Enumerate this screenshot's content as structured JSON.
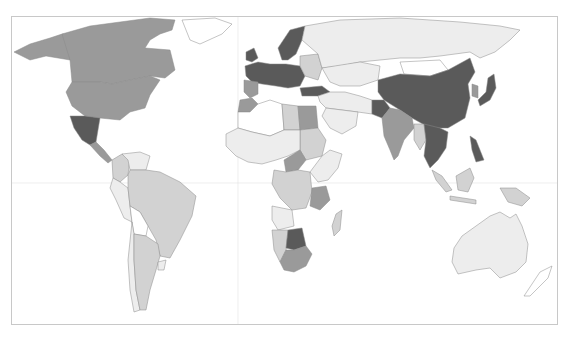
{
  "map": {
    "type": "choropleth-world-map",
    "projection": "equirectangular-like",
    "frame": {
      "x": 11,
      "y": 16,
      "width": 547,
      "height": 309
    },
    "gridlines": {
      "equator_y": 183,
      "prime_meridian_x": 238
    },
    "palette": {
      "class_0": "#ffffff",
      "class_1": "#ededed",
      "class_2": "#d2d2d2",
      "class_3": "#9a9a9a",
      "class_4": "#5a5a5a"
    },
    "regions": [
      {
        "name": "Canada",
        "class": "class_3"
      },
      {
        "name": "United States",
        "class": "class_3"
      },
      {
        "name": "Alaska",
        "class": "class_3"
      },
      {
        "name": "Greenland",
        "class": "class_0"
      },
      {
        "name": "Mexico",
        "class": "class_4"
      },
      {
        "name": "Central America",
        "class": "class_3"
      },
      {
        "name": "Colombia",
        "class": "class_2"
      },
      {
        "name": "Venezuela",
        "class": "class_1"
      },
      {
        "name": "Peru",
        "class": "class_1"
      },
      {
        "name": "Brazil",
        "class": "class_2"
      },
      {
        "name": "Bolivia",
        "class": "class_0"
      },
      {
        "name": "Chile",
        "class": "class_1"
      },
      {
        "name": "Argentina",
        "class": "class_2"
      },
      {
        "name": "Uruguay",
        "class": "class_1"
      },
      {
        "name": "Western Europe",
        "class": "class_4"
      },
      {
        "name": "Scandinavia",
        "class": "class_4"
      },
      {
        "name": "Iberia",
        "class": "class_3"
      },
      {
        "name": "Eastern Europe",
        "class": "class_2"
      },
      {
        "name": "Turkey",
        "class": "class_4"
      },
      {
        "name": "Russia",
        "class": "class_1"
      },
      {
        "name": "Kazakhstan",
        "class": "class_1"
      },
      {
        "name": "Mongolia",
        "class": "class_0"
      },
      {
        "name": "China",
        "class": "class_4"
      },
      {
        "name": "Japan",
        "class": "class_4"
      },
      {
        "name": "Korea",
        "class": "class_3"
      },
      {
        "name": "India",
        "class": "class_3"
      },
      {
        "name": "Pakistan",
        "class": "class_4"
      },
      {
        "name": "Middle East",
        "class": "class_1"
      },
      {
        "name": "Saudi Arabia",
        "class": "class_1"
      },
      {
        "name": "Southeast Asia",
        "class": "class_4"
      },
      {
        "name": "Myanmar",
        "class": "class_2"
      },
      {
        "name": "Indonesia",
        "class": "class_2"
      },
      {
        "name": "Borneo",
        "class": "class_2"
      },
      {
        "name": "Papua New Guinea",
        "class": "class_2"
      },
      {
        "name": "Philippines",
        "class": "class_4"
      },
      {
        "name": "Australia",
        "class": "class_1"
      },
      {
        "name": "New Zealand",
        "class": "class_0"
      },
      {
        "name": "North Africa West",
        "class": "class_0"
      },
      {
        "name": "Morocco",
        "class": "class_3"
      },
      {
        "name": "Libya",
        "class": "class_2"
      },
      {
        "name": "Egypt",
        "class": "class_3"
      },
      {
        "name": "Sudan",
        "class": "class_2"
      },
      {
        "name": "West Africa",
        "class": "class_1"
      },
      {
        "name": "Central African Republic",
        "class": "class_3"
      },
      {
        "name": "Congo",
        "class": "class_2"
      },
      {
        "name": "East Africa",
        "class": "class_1"
      },
      {
        "name": "Tanzania",
        "class": "class_3"
      },
      {
        "name": "Angola",
        "class": "class_1"
      },
      {
        "name": "Namibia",
        "class": "class_2"
      },
      {
        "name": "Botswana",
        "class": "class_4"
      },
      {
        "name": "South Africa",
        "class": "class_3"
      },
      {
        "name": "Madagascar",
        "class": "class_2"
      }
    ]
  }
}
